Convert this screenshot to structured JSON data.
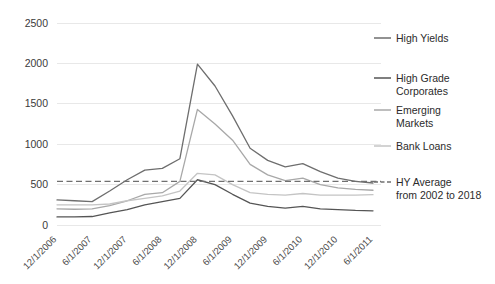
{
  "chart_data": {
    "type": "line",
    "title": "",
    "subtitle": "",
    "xlabel": "",
    "ylabel": "",
    "grid": true,
    "legend_position": "right",
    "ylim": [
      0,
      2500
    ],
    "yticks": [
      "0",
      "500",
      "1000",
      "1500",
      "2000",
      "2500"
    ],
    "ytick_values": [
      0,
      500,
      1000,
      1500,
      2000,
      2500
    ],
    "x": [
      "12/1/2006",
      "3/1/2007",
      "6/1/2007",
      "9/1/2007",
      "12/1/2007",
      "3/1/2008",
      "6/1/2008",
      "9/1/2008",
      "12/1/2008",
      "3/1/2009",
      "6/1/2009",
      "9/1/2009",
      "12/1/2009",
      "3/1/2010",
      "6/1/2010",
      "9/1/2010",
      "12/1/2010",
      "3/1/2011",
      "6/1/2011"
    ],
    "xticks": [
      "12/1/2006",
      "6/1/2007",
      "12/1/2007",
      "6/1/2008",
      "12/1/2008",
      "6/1/2009",
      "12/1/2009",
      "6/1/2010",
      "12/1/2010",
      "6/1/2011"
    ],
    "series": [
      {
        "name": "High Yields",
        "color": "#6e6e6e",
        "style": "solid",
        "values": [
          310,
          300,
          290,
          420,
          560,
          680,
          700,
          820,
          1990,
          1720,
          1350,
          950,
          800,
          720,
          760,
          660,
          580,
          540,
          520
        ]
      },
      {
        "name": "High Grade Corporates",
        "color": "#555555",
        "style": "solid",
        "values": [
          100,
          100,
          105,
          150,
          190,
          250,
          290,
          330,
          560,
          500,
          380,
          270,
          230,
          210,
          230,
          200,
          190,
          180,
          175
        ]
      },
      {
        "name": "Emerging Markets",
        "color": "#a8a8a8",
        "style": "solid",
        "values": [
          200,
          195,
          200,
          240,
          300,
          380,
          400,
          540,
          1430,
          1250,
          1050,
          750,
          620,
          550,
          580,
          500,
          460,
          440,
          430
        ]
      },
      {
        "name": "Bank Loans",
        "color": "#c4c4c4",
        "style": "solid",
        "values": [
          250,
          250,
          250,
          260,
          300,
          330,
          360,
          420,
          640,
          620,
          500,
          400,
          380,
          370,
          390,
          370,
          370,
          370,
          375
        ]
      }
    ],
    "reference_line": {
      "name": "HY Average from 2002 to 2018",
      "label_line1": "HY Average",
      "label_line2": "from 2002 to 2018",
      "value": 540,
      "color": "#707070",
      "style": "dashed"
    }
  },
  "legend": {
    "items": [
      {
        "label": "High Yields",
        "label2": "",
        "color": "#6e6e6e",
        "style": "solid"
      },
      {
        "label": "High Grade",
        "label2": "Corporates",
        "color": "#555555",
        "style": "solid"
      },
      {
        "label": "Emerging",
        "label2": "Markets",
        "color": "#a8a8a8",
        "style": "solid"
      },
      {
        "label": "Bank Loans",
        "label2": "",
        "color": "#c4c4c4",
        "style": "solid"
      },
      {
        "label": "HY Average",
        "label2": "from 2002 to 2018",
        "color": "#707070",
        "style": "dashed"
      }
    ]
  }
}
